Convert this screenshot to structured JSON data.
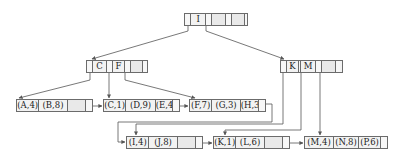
{
  "diagram": {
    "type": "B+ tree",
    "root": {
      "keys": [
        "I",
        "",
        ""
      ]
    },
    "internal": [
      {
        "keys": [
          "C",
          "F",
          ""
        ]
      },
      {
        "keys": [
          "K",
          "M",
          ""
        ]
      }
    ],
    "leaves": [
      {
        "entries": [
          "(A,4)",
          "(B,8)",
          ""
        ]
      },
      {
        "entries": [
          "(C,1)",
          "(D,9)",
          "(E,4)"
        ]
      },
      {
        "entries": [
          "(F,7)",
          "(G,3)",
          "(H,3)"
        ]
      },
      {
        "entries": [
          "(I,4)",
          "(J,8)",
          ""
        ]
      },
      {
        "entries": [
          "(K,1)",
          "(L,6)",
          ""
        ]
      },
      {
        "entries": [
          "(M,4)",
          "(N,8)",
          "(P,6)"
        ]
      }
    ]
  },
  "colors": {
    "line": "#555555",
    "cell_fill": "#f2f2f2",
    "empty_fill": "#e9e9e9"
  }
}
